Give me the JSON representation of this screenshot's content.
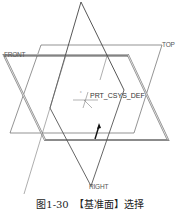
{
  "figure": {
    "caption": "图1-30　【基准面】选择",
    "planes": [
      {
        "name": "FRONT",
        "label": "FRONT"
      },
      {
        "name": "TOP",
        "label": "TOP"
      },
      {
        "name": "RIGHT",
        "label": "RIGHT"
      }
    ],
    "csys_label": "PRT_CSYS_DEF",
    "colors": {
      "front_plane": "#777777",
      "top_plane": "#666666",
      "right_plane": "#444444",
      "arrow": "#111111"
    }
  }
}
